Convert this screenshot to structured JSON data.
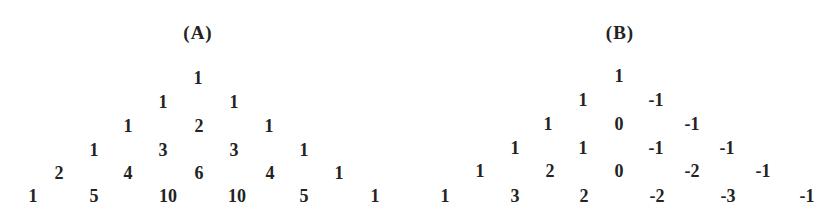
{
  "figure": {
    "triangles": [
      {
        "label": "(A)",
        "rows": [
          [
            "1"
          ],
          [
            "1",
            "1"
          ],
          [
            "1",
            "2",
            "1"
          ],
          [
            "1",
            "3",
            "3",
            "1"
          ],
          [
            "2",
            "4",
            "6",
            "4",
            "1"
          ],
          [
            "1",
            "5",
            "10",
            "10",
            "5",
            "1"
          ]
        ]
      },
      {
        "label": "(B)",
        "rows": [
          [
            "1"
          ],
          [
            "1",
            "-1"
          ],
          [
            "1",
            "0",
            "-1"
          ],
          [
            "1",
            "1",
            "-1",
            "-1"
          ],
          [
            "1",
            "2",
            "0",
            "-2",
            "-1"
          ],
          [
            "1",
            "3",
            "2",
            "-2",
            "-3",
            "-1"
          ]
        ]
      }
    ]
  },
  "colors": {
    "text": "#232323",
    "background": "#ffffff"
  }
}
